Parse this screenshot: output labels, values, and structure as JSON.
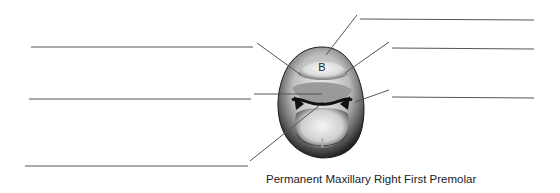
{
  "caption": "Permanent Maxillary Right First Premolar",
  "tooth": {
    "buccal_label": "B",
    "lingual_label": "L"
  },
  "label_blanks": [
    {
      "side": "left",
      "index": 1,
      "value": ""
    },
    {
      "side": "left",
      "index": 2,
      "value": ""
    },
    {
      "side": "left",
      "index": 3,
      "value": ""
    },
    {
      "side": "right",
      "index": 1,
      "value": ""
    },
    {
      "side": "right",
      "index": 2,
      "value": ""
    },
    {
      "side": "right",
      "index": 3,
      "value": ""
    }
  ],
  "colors": {
    "line": "#555555",
    "tooth_dark": "#2a2a2a",
    "tooth_light": "#e6e6e6"
  }
}
